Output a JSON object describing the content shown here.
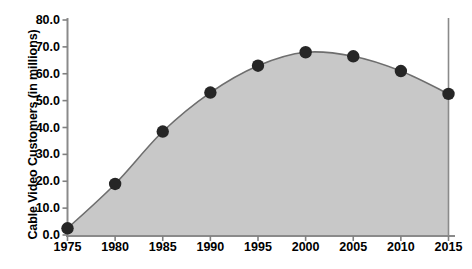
{
  "chart_data": {
    "type": "area",
    "title": "",
    "xlabel": "",
    "ylabel": "Cable Video Customers (in millions)",
    "x": [
      1975,
      1980,
      1985,
      1990,
      1995,
      2000,
      2005,
      2010,
      2015
    ],
    "values": [
      2.5,
      19.0,
      38.5,
      53.0,
      63.0,
      68.0,
      66.5,
      61.0,
      52.5
    ],
    "categories": [
      "1975",
      "1980",
      "1985",
      "1990",
      "1995",
      "2000",
      "2005",
      "2010",
      "2015"
    ],
    "xtick_labels": [
      "1975",
      "1980",
      "1985",
      "1990",
      "1995",
      "2000",
      "2005",
      "2010",
      "2015"
    ],
    "ytick_labels": [
      "0.0",
      "10.0",
      "20.0",
      "30.0",
      "40.0",
      "50.0",
      "60.0",
      "70.0",
      "80.0"
    ],
    "ytick_values": [
      0,
      10,
      20,
      30,
      40,
      50,
      60,
      70,
      80
    ],
    "xlim": [
      1975,
      2015
    ],
    "ylim": [
      0,
      80
    ],
    "grid": false,
    "legend": false,
    "marker": "circle",
    "smooth": true,
    "colors": {
      "area_fill": "#c8c8c8",
      "line": "#6e6e6e",
      "marker": "#262626",
      "axis": "#808080",
      "text": "#000000",
      "background": "#ffffff"
    }
  }
}
